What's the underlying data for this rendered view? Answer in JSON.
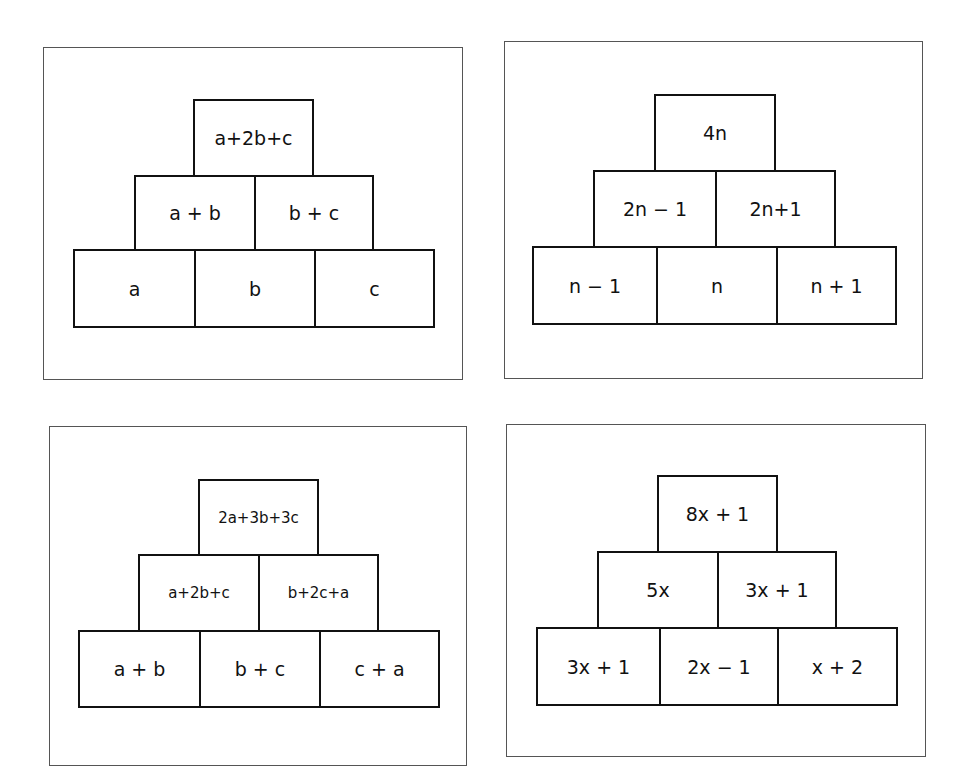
{
  "pyramids": [
    {
      "id": "pyramid-abc",
      "top": "a+2b+c",
      "middle": [
        "a + b",
        "b + c"
      ],
      "bottom": [
        "a",
        "b",
        "c"
      ]
    },
    {
      "id": "pyramid-n",
      "top": "4n",
      "middle": [
        "2n − 1",
        "2n+1"
      ],
      "bottom": [
        "n − 1",
        "n",
        "n + 1"
      ]
    },
    {
      "id": "pyramid-abc-sums",
      "top": "2a+3b+3c",
      "middle": [
        "a+2b+c",
        "b+2c+a"
      ],
      "bottom": [
        "a + b",
        "b + c",
        "c + a"
      ]
    },
    {
      "id": "pyramid-x",
      "top": "8x + 1",
      "middle": [
        "5x",
        "3x + 1"
      ],
      "bottom": [
        "3x + 1",
        "2x − 1",
        "x + 2"
      ]
    }
  ],
  "colors": {
    "border": "#111111",
    "panel_border": "#555555",
    "background": "#ffffff"
  }
}
